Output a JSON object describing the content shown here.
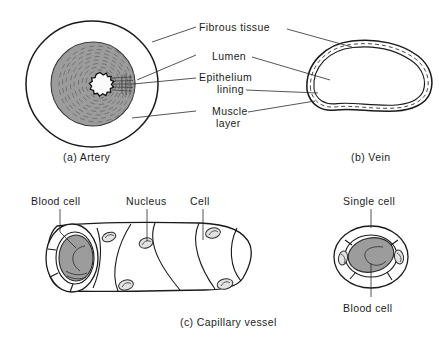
{
  "figure": {
    "background_color": "#ffffff",
    "ink_color": "#1a1a1a",
    "fill_gray": "#9c9c9c"
  },
  "panels": {
    "artery": {
      "caption": "(a) Artery",
      "labels": {
        "fibrous_tissue": "Fibrous tissue",
        "lumen": "Lumen",
        "epithelium_line1": "Epithelium",
        "epithelium_line2": "lining",
        "muscle_line1": "Muscle",
        "muscle_line2": "layer"
      }
    },
    "vein": {
      "caption": "(b) Vein"
    },
    "capillary": {
      "caption": "(c) Capillary vessel",
      "labels": {
        "blood_cell": "Blood cell",
        "nucleus": "Nucleus",
        "cell": "Cell"
      }
    },
    "single_cell": {
      "labels": {
        "single_cell": "Single cell",
        "blood_cell": "Blood cell"
      }
    }
  }
}
